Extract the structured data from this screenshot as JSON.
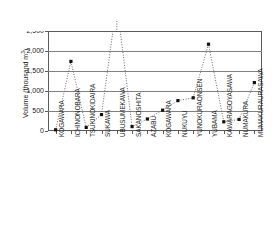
{
  "chart_data": {
    "type": "line",
    "title": "",
    "xlabel": "",
    "ylabel": "Volume (thousand m3)",
    "ylabel_prefix": "Volume (thousand m",
    "ylabel_superscript": "3",
    "ylabel_suffix": ")",
    "ylim": [
      0,
      2500
    ],
    "yticks": [
      0,
      500,
      1000,
      1500,
      2000,
      2500
    ],
    "ytick_labels": [
      "0",
      "500",
      "1,000",
      "1,500",
      "2,000",
      "2,500"
    ],
    "grid": true,
    "legend": "none",
    "marker": "square",
    "line_style": "dotted",
    "categories": [
      "KOGAWARA",
      "ICHINONOBARA",
      "TSUKINOKIDAIRA",
      "SUKAWA",
      "UBUSUMEKAWA",
      "SAKANOSHITA",
      "AZABU",
      "KOGAWARA",
      "NUKUYU",
      "YUNOKURAONSEN",
      "YUBAMA",
      "KAWARAGOYASAWA",
      "NUMAKURA",
      "MUMAKURAURASAWA"
    ],
    "values": [
      30,
      1740,
      90,
      410,
      12600,
      110,
      300,
      520,
      760,
      830,
      2170,
      230,
      290,
      1210
    ],
    "offscale_indices": [
      4
    ],
    "annotations": [
      {
        "label": "12,600",
        "arrow": "↑",
        "category": "UBUSUMEKAWA",
        "value": 12600,
        "note": "off-scale value marked above plot"
      }
    ]
  }
}
